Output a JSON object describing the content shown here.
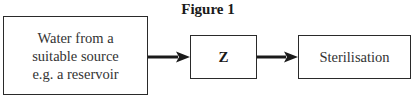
{
  "figure": {
    "title": "Figure 1"
  },
  "flow": {
    "steps": [
      {
        "id": "source",
        "lines": [
          "Water from a",
          "suitable source",
          "e.g. a reservoir"
        ]
      },
      {
        "id": "z",
        "label": "Z"
      },
      {
        "id": "sterilisation",
        "label": "Sterilisation"
      }
    ],
    "connections": [
      {
        "from": "source",
        "to": "z"
      },
      {
        "from": "z",
        "to": "sterilisation"
      }
    ]
  },
  "colors": {
    "stroke": "#2a2a2a",
    "text": "#333333",
    "background": "#ffffff"
  }
}
